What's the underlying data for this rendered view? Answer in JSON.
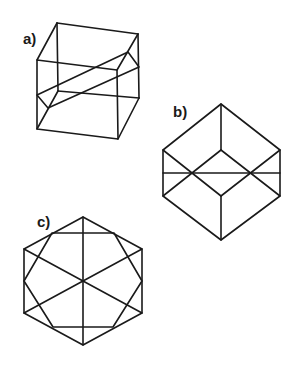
{
  "figures": [
    {
      "label": "a)",
      "description": "Cube in oblique projection with a slanted cutting plane through it",
      "label_pos": [
        23,
        31
      ]
    },
    {
      "label": "b)",
      "description": "Cube viewed along a body diagonal (hexagonal outline) with a horizontal section line",
      "label_pos": [
        173,
        104
      ]
    },
    {
      "label": "c)",
      "description": "Hexagonal outline with inscribed octagonal section and three diagonals through the center",
      "label_pos": [
        37,
        214
      ]
    }
  ],
  "colors": {
    "background": "#ffffff",
    "stroke": "#1a1a1a"
  }
}
